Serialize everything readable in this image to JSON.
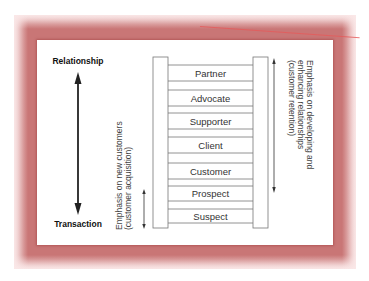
{
  "diagram": {
    "axis": {
      "top_label": "Relationship",
      "bottom_label": "Transaction"
    },
    "ladder_rungs": [
      "Partner",
      "Advocate",
      "Supporter",
      "Client",
      "Customer",
      "Prospect",
      "Suspect"
    ],
    "left_note": {
      "line1": "Emphasis on new customers",
      "line2": "(customer acquisition)"
    },
    "right_note": {
      "line1": "Emphasis on developing and",
      "line2": "enhancing relationships",
      "line3": "(customer retention)"
    },
    "colors": {
      "frame": "#c97676",
      "frame_light": "#fae8e8",
      "panel": "#ffffff",
      "lines": "#666666",
      "arrow": "#222222"
    }
  }
}
